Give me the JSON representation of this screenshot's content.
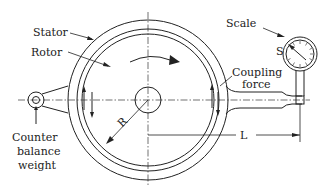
{
  "diagram": {
    "labels": {
      "stator": "Stator",
      "rotor": "Rotor",
      "scale": "Scale",
      "scale_symbol": "S",
      "coupling_force_line1": "Coupling",
      "coupling_force_line2": "force",
      "counter_line1": "Counter",
      "counter_line2": "balance",
      "counter_line3": "weight",
      "radius": "R",
      "length": "L"
    },
    "colors": {
      "ink": "#222222",
      "background": "#ffffff"
    }
  }
}
